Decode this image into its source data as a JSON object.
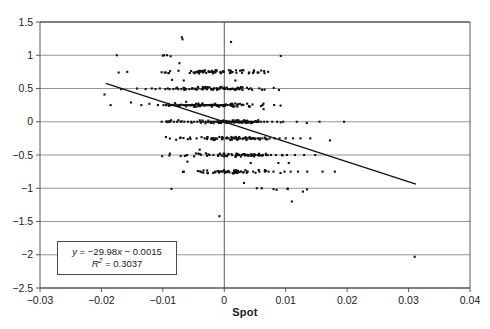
{
  "figure": {
    "xlabel": "Spot",
    "equation_prefix": "y",
    "equation_body": " = −29.98",
    "equation_var": "x",
    "equation_suffix": " − 0.0015",
    "r2_symbol": "R",
    "r2_value": " = 0.3037",
    "r2_exponent": "2"
  },
  "chart_data": {
    "type": "scatter",
    "title": "",
    "xlabel": "Spot",
    "ylabel": "",
    "xlim": [
      -0.03,
      0.04
    ],
    "ylim": [
      -2.5,
      1.5
    ],
    "xticks": [
      -0.03,
      -0.02,
      -0.01,
      0,
      0.01,
      0.02,
      0.03,
      0.04
    ],
    "xticklabels": [
      "−0.03",
      "−0.02",
      "−0.01",
      "0",
      "0.01",
      "0.02",
      "0.03",
      "0.04"
    ],
    "yticks": [
      -2.5,
      -2,
      -1.5,
      -1,
      -0.5,
      0,
      0.5,
      1,
      1.5
    ],
    "yticklabels": [
      "−2.5",
      "−2",
      "−1.5",
      "−1",
      "−0.5",
      "0",
      "0.5",
      "1",
      "1.5"
    ],
    "grid": "horizontal",
    "legend": "none",
    "marker_color": "#111111",
    "marker_size": 2.1,
    "gridline_color": "#8a8a8a",
    "axis_color": "#4a4a4a",
    "trendline": {
      "slope": -29.98,
      "intercept": -0.0015,
      "r_squared": 0.3037,
      "label": "y = −29.98x − 0.0015",
      "x_start": -0.0193,
      "x_end": 0.0312,
      "color": "#111111"
    },
    "annotations": [
      {
        "text": "y = −29.98x − 0.0015",
        "x": -0.0245,
        "y": -1.98
      },
      {
        "text": "R² = 0.3037",
        "x": -0.0245,
        "y": -2.14
      }
    ],
    "n_points": 620,
    "points": [
      [
        -0.0195,
        0.41
      ],
      [
        -0.0185,
        0.25
      ],
      [
        -0.0175,
        1.0
      ],
      [
        -0.0172,
        0.74
      ],
      [
        -0.0168,
        0.49
      ],
      [
        -0.0158,
        0.75
      ],
      [
        -0.0152,
        0.29
      ],
      [
        -0.0142,
        0.5
      ],
      [
        -0.0135,
        0.25
      ],
      [
        -0.0128,
        0.49
      ],
      [
        -0.0122,
        0.27
      ],
      [
        -0.0118,
        0.5
      ],
      [
        -0.0112,
        0.49
      ],
      [
        -0.0108,
        0.25
      ],
      [
        -0.0105,
        0.5
      ],
      [
        -0.0102,
        0.0
      ],
      [
        -0.0099,
        0.25
      ],
      [
        -0.0098,
        1.0
      ],
      [
        -0.0097,
        0.74
      ],
      [
        -0.0096,
        0.49
      ],
      [
        -0.0095,
        0.25
      ],
      [
        -0.0094,
        0.25
      ],
      [
        -0.0093,
        0.0
      ],
      [
        -0.0092,
        0.5
      ],
      [
        -0.0091,
        0.27
      ],
      [
        -0.009,
        0.24
      ],
      [
        -0.0089,
        0.49
      ],
      [
        -0.0088,
        0.0
      ],
      [
        -0.0087,
        0.25
      ],
      [
        -0.0086,
        -1.01
      ],
      [
        -0.0085,
        0.63
      ],
      [
        -0.0084,
        0.25
      ],
      [
        -0.0083,
        0.49
      ],
      [
        -0.0082,
        0.0
      ],
      [
        -0.0081,
        0.25
      ],
      [
        -0.008,
        0.28
      ],
      [
        -0.0079,
        0.5
      ],
      [
        -0.0078,
        0.25
      ],
      [
        -0.0077,
        0.0
      ],
      [
        -0.0076,
        0.24
      ],
      [
        -0.0075,
        0.49
      ],
      [
        -0.0074,
        0.25
      ],
      [
        -0.0073,
        0.88
      ],
      [
        -0.0072,
        0.25
      ],
      [
        -0.0071,
        0.0
      ],
      [
        -0.007,
        0.49
      ],
      [
        -0.0069,
        1.27
      ],
      [
        -0.0068,
        1.24
      ],
      [
        -0.0067,
        0.25
      ],
      [
        -0.0066,
        0.62
      ],
      [
        -0.0065,
        0.0
      ],
      [
        -0.0064,
        0.25
      ],
      [
        -0.0063,
        0.49
      ],
      [
        -0.0062,
        0.3
      ],
      [
        -0.0061,
        0.25
      ],
      [
        -0.006,
        -0.6
      ],
      [
        -0.0059,
        0.0
      ],
      [
        -0.0058,
        0.25
      ],
      [
        -0.0057,
        0.49
      ],
      [
        -0.0056,
        0.25
      ],
      [
        -0.0055,
        -0.26
      ],
      [
        -0.0054,
        0.0
      ],
      [
        -0.0053,
        0.25
      ],
      [
        -0.0052,
        0.5
      ],
      [
        -0.0051,
        0.25
      ],
      [
        -0.005,
        0.74
      ],
      [
        -0.0049,
        0.0
      ],
      [
        -0.0048,
        0.25
      ],
      [
        -0.0047,
        0.49
      ],
      [
        -0.0046,
        0.27
      ],
      [
        -0.0045,
        -0.25
      ],
      [
        -0.0044,
        0.0
      ],
      [
        -0.0043,
        0.25
      ],
      [
        -0.0042,
        0.5
      ],
      [
        -0.0041,
        0.25
      ],
      [
        -0.004,
        -0.42
      ],
      [
        -0.0039,
        0.0
      ],
      [
        -0.0038,
        0.25
      ],
      [
        -0.0037,
        0.49
      ],
      [
        -0.0036,
        0.25
      ],
      [
        -0.0035,
        0.74
      ],
      [
        -0.0034,
        0.0
      ],
      [
        -0.0033,
        0.25
      ],
      [
        -0.0032,
        -0.25
      ],
      [
        -0.0031,
        0.25
      ],
      [
        -0.003,
        0.0
      ],
      [
        -0.0029,
        0.25
      ],
      [
        -0.0028,
        0.49
      ],
      [
        -0.0027,
        0.25
      ],
      [
        -0.0026,
        0.0
      ],
      [
        -0.0025,
        0.25
      ],
      [
        -0.0024,
        -0.5
      ],
      [
        -0.0023,
        0.25
      ],
      [
        -0.0022,
        0.0
      ],
      [
        -0.0021,
        0.49
      ],
      [
        -0.002,
        0.25
      ],
      [
        -0.0019,
        0.0
      ],
      [
        -0.0018,
        0.25
      ],
      [
        -0.0017,
        0.5
      ],
      [
        -0.0016,
        0.0
      ],
      [
        -0.0015,
        0.25
      ],
      [
        -0.0014,
        -0.25
      ],
      [
        -0.0013,
        0.0
      ],
      [
        -0.0012,
        0.25
      ],
      [
        -0.0011,
        0.49
      ],
      [
        -0.001,
        0.0
      ],
      [
        -0.0009,
        0.25
      ],
      [
        -0.0008,
        -1.42
      ],
      [
        -0.0007,
        0.0
      ],
      [
        -0.0006,
        0.25
      ],
      [
        -0.0005,
        0.0
      ],
      [
        -0.0004,
        0.25
      ],
      [
        -0.0003,
        0.0
      ],
      [
        -0.0002,
        0.25
      ],
      [
        -0.0001,
        0.0
      ],
      [
        0.0,
        0.0
      ],
      [
        0.0001,
        0.25
      ],
      [
        0.0002,
        0.0
      ],
      [
        0.0003,
        -0.25
      ],
      [
        0.0004,
        0.0
      ],
      [
        0.0005,
        0.25
      ],
      [
        0.0006,
        0.0
      ],
      [
        0.0007,
        -0.25
      ],
      [
        0.0008,
        0.0
      ],
      [
        0.0009,
        0.49
      ],
      [
        0.001,
        0.0
      ],
      [
        0.0011,
        1.2
      ],
      [
        0.0012,
        -0.25
      ],
      [
        0.0013,
        0.0
      ],
      [
        0.0014,
        0.25
      ],
      [
        0.0015,
        0.0
      ],
      [
        0.0016,
        -0.25
      ],
      [
        0.0017,
        0.0
      ],
      [
        0.0018,
        0.62
      ],
      [
        0.0019,
        -0.5
      ],
      [
        0.002,
        0.0
      ],
      [
        0.0021,
        0.25
      ],
      [
        0.0022,
        -0.25
      ],
      [
        0.0023,
        0.0
      ],
      [
        0.0024,
        -0.5
      ],
      [
        0.0025,
        0.0
      ],
      [
        0.0026,
        -0.25
      ],
      [
        0.0027,
        0.0
      ],
      [
        0.0028,
        -0.5
      ],
      [
        0.0029,
        0.25
      ],
      [
        0.003,
        0.0
      ],
      [
        0.0031,
        -0.25
      ],
      [
        0.0032,
        -0.92
      ],
      [
        0.0033,
        0.0
      ],
      [
        0.0034,
        -0.5
      ],
      [
        0.0035,
        -0.25
      ],
      [
        0.0036,
        0.0
      ],
      [
        0.0037,
        -0.75
      ],
      [
        0.0038,
        -0.25
      ],
      [
        0.0039,
        0.0
      ],
      [
        0.004,
        -0.5
      ],
      [
        0.0041,
        -0.25
      ],
      [
        0.0042,
        0.0
      ],
      [
        0.0043,
        -0.62
      ],
      [
        0.0044,
        -0.25
      ],
      [
        0.0045,
        0.0
      ],
      [
        0.0046,
        -0.5
      ],
      [
        0.0047,
        -0.75
      ],
      [
        0.0048,
        -0.25
      ],
      [
        0.0049,
        0.0
      ],
      [
        0.005,
        -0.5
      ],
      [
        0.0051,
        -0.25
      ],
      [
        0.0052,
        0.0
      ],
      [
        0.0053,
        -1.0
      ],
      [
        0.0054,
        -0.5
      ],
      [
        0.0055,
        -0.25
      ],
      [
        0.0056,
        0.0
      ],
      [
        0.0057,
        -0.75
      ],
      [
        0.0058,
        -0.25
      ],
      [
        0.0059,
        -0.5
      ],
      [
        0.006,
        0.0
      ],
      [
        0.0061,
        -1.0
      ],
      [
        0.0062,
        -0.25
      ],
      [
        0.0063,
        -0.5
      ],
      [
        0.0064,
        0.19
      ],
      [
        0.0065,
        0.0
      ],
      [
        0.0066,
        -0.75
      ],
      [
        0.0067,
        -0.25
      ],
      [
        0.0068,
        -0.5
      ],
      [
        0.007,
        0.0
      ],
      [
        0.0072,
        -0.75
      ],
      [
        0.0074,
        -0.25
      ],
      [
        0.0076,
        -0.5
      ],
      [
        0.0078,
        0.0
      ],
      [
        0.008,
        -0.75
      ],
      [
        0.0082,
        -0.25
      ],
      [
        0.0084,
        -0.5
      ],
      [
        0.0086,
        0.0
      ],
      [
        0.0088,
        -0.62
      ],
      [
        0.009,
        -0.25
      ],
      [
        0.0092,
        0.99
      ],
      [
        0.0094,
        -0.5
      ],
      [
        0.0096,
        0.0
      ],
      [
        0.0098,
        -0.75
      ],
      [
        0.01,
        -0.25
      ],
      [
        0.0102,
        -0.5
      ],
      [
        0.0105,
        -0.62
      ],
      [
        0.0108,
        -0.75
      ],
      [
        0.011,
        -1.2
      ],
      [
        0.0112,
        -0.25
      ],
      [
        0.0115,
        -0.5
      ],
      [
        0.0118,
        0.0
      ],
      [
        0.012,
        -0.75
      ],
      [
        0.0124,
        -0.25
      ],
      [
        0.0128,
        -1.05
      ],
      [
        0.013,
        -0.5
      ],
      [
        0.0135,
        -0.75
      ],
      [
        0.014,
        -0.25
      ],
      [
        0.0148,
        -0.5
      ],
      [
        0.0155,
        0.0
      ],
      [
        0.016,
        -0.75
      ],
      [
        0.0172,
        -0.28
      ],
      [
        0.018,
        -0.75
      ],
      [
        0.0195,
        0.0
      ],
      [
        0.031,
        -2.03
      ]
    ],
    "note": "Dense cluster of ~620 observations concentrated near x=0 with values quantized to 0.25 increments; strong negative relationship"
  }
}
